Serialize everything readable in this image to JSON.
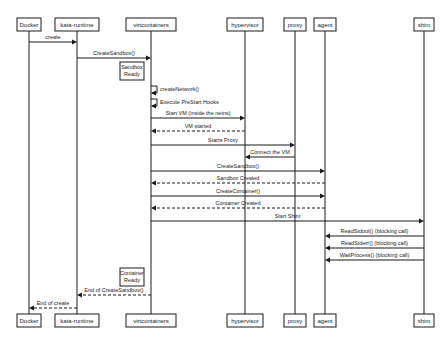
{
  "participants": [
    {
      "id": "docker",
      "label": "Docker"
    },
    {
      "id": "kata-runtime",
      "label": "kata-runtime"
    },
    {
      "id": "virtcontainers",
      "label": "virtcontainers"
    },
    {
      "id": "hypervisor",
      "label": "hypervisor"
    },
    {
      "id": "proxy",
      "label": "proxy"
    },
    {
      "id": "agent",
      "label": "agent"
    },
    {
      "id": "shim",
      "label": "shim"
    }
  ],
  "messages": [
    {
      "from": "docker",
      "to": "kata-runtime",
      "label": "create",
      "style": "solid"
    },
    {
      "from": "kata-runtime",
      "to": "virtcontainers",
      "label": "CreateSandbox()",
      "style": "solid"
    },
    {
      "note": "Sandbox\nReady",
      "at": "virtcontainers"
    },
    {
      "from": "virtcontainers",
      "to": "virtcontainers",
      "label": "createNetwork()",
      "style": "self"
    },
    {
      "from": "virtcontainers",
      "to": "virtcontainers",
      "label": "Execute PreStart Hooks",
      "style": "self"
    },
    {
      "from": "virtcontainers",
      "to": "hypervisor",
      "label": "Start VM (inside the netns)",
      "style": "solid"
    },
    {
      "from": "hypervisor",
      "to": "virtcontainers",
      "label": "VM started",
      "style": "dashed"
    },
    {
      "from": "virtcontainers",
      "to": "proxy",
      "label": "Starts Proxy",
      "style": "solid"
    },
    {
      "from": "proxy",
      "to": "hypervisor",
      "label": "Connect the VM",
      "style": "solid"
    },
    {
      "from": "virtcontainers",
      "to": "agent",
      "label": "CreateSandbox()",
      "style": "solid"
    },
    {
      "from": "agent",
      "to": "virtcontainers",
      "label": "Sandbox Created",
      "style": "dashed"
    },
    {
      "from": "virtcontainers",
      "to": "agent",
      "label": "CreateContainer()",
      "style": "solid"
    },
    {
      "from": "agent",
      "to": "virtcontainers",
      "label": "Container Created",
      "style": "dashed"
    },
    {
      "from": "virtcontainers",
      "to": "shim",
      "label": "Start Shim",
      "style": "solid"
    },
    {
      "from": "shim",
      "to": "agent",
      "label": "ReadStdout()  (blocking call)",
      "style": "solid"
    },
    {
      "from": "shim",
      "to": "agent",
      "label": "ReadStderr()  (blocking call)",
      "style": "solid"
    },
    {
      "from": "shim",
      "to": "agent",
      "label": "WaitProcess()  (blocking call)",
      "style": "solid"
    },
    {
      "note": "Container\nReady",
      "at": "virtcontainers"
    },
    {
      "from": "virtcontainers",
      "to": "kata-runtime",
      "label": "End of CreateSandbox()",
      "style": "dashed"
    },
    {
      "from": "kata-runtime",
      "to": "docker",
      "label": "End of create",
      "style": "dashed"
    }
  ]
}
